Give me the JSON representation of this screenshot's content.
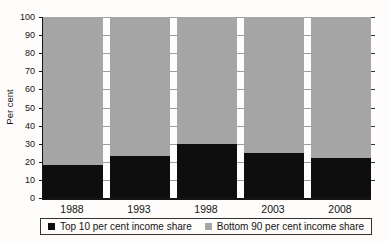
{
  "chart_data": {
    "type": "bar",
    "stacked": true,
    "categories": [
      "1988",
      "1993",
      "1998",
      "2003",
      "2008"
    ],
    "series": [
      {
        "name": "Top 10 per cent income share",
        "color": "#0e0e0e",
        "values": [
          18,
          23,
          30,
          25,
          22
        ]
      },
      {
        "name": "Bottom 90 per cent income share",
        "color": "#a5a5a5",
        "values": [
          82,
          77,
          70,
          75,
          78
        ]
      }
    ],
    "title": "",
    "xlabel": "",
    "ylabel": "Per cent",
    "ylim": [
      0,
      100
    ],
    "yticks": [
      0,
      10,
      20,
      30,
      40,
      50,
      60,
      70,
      80,
      90,
      100
    ],
    "grid": true,
    "legend_position": "bottom"
  }
}
